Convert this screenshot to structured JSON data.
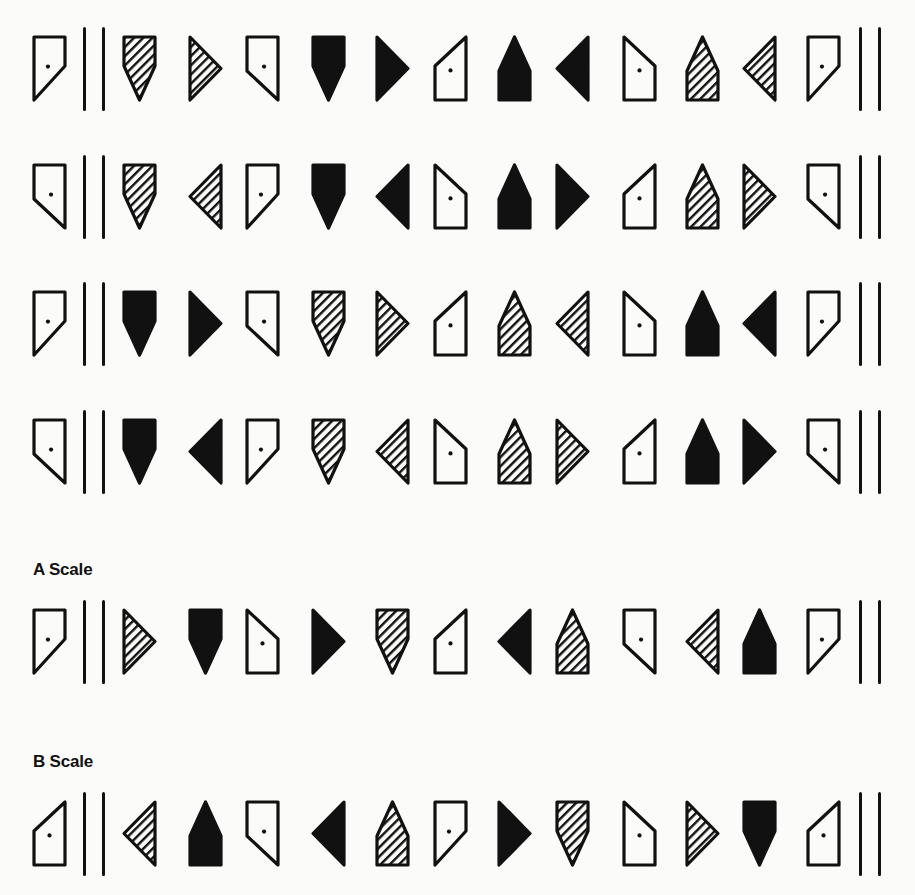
{
  "page": {
    "colors": {
      "ink": "#111111",
      "paper": "#fbfbf9"
    }
  },
  "labels": {
    "a_scale": "A Scale",
    "b_scale": "B Scale"
  },
  "legend": {
    "fills": [
      "open",
      "hatched",
      "solid"
    ],
    "shapes": {
      "open-cut-br": "open pentagon, flat top, diagonal cut bottom-right to lower-left, with dot",
      "open-cut-bl": "open pentagon, flat top, diagonal cut bottom-left to lower-right, with dot",
      "open-cut-tl": "open pentagon, flat bottom, diagonal top-right down to left, with dot",
      "open-cut-tr": "open pentagon, flat bottom, diagonal top-left down to right, with dot",
      "shield-down": "pentagon pointing down",
      "house-up": "pentagon pointing up",
      "tri-right": "triangle pointing right",
      "tri-left": "triangle pointing left",
      "double-bar": "two vertical bars"
    }
  },
  "rows": [
    {
      "id": "row-1",
      "y": 35,
      "items": [
        "open-cut-br",
        "double-bar",
        "hatched-shield-down",
        "hatched-tri-right",
        "open-cut-bl",
        "solid-shield-down",
        "solid-tri-right",
        "open-cut-tl",
        "solid-house-up",
        "solid-tri-left",
        "open-cut-tr",
        "hatched-house-up",
        "hatched-tri-left",
        "open-cut-br",
        "double-bar"
      ]
    },
    {
      "id": "row-2",
      "y": 163,
      "items": [
        "open-cut-bl",
        "double-bar",
        "hatched-shield-down",
        "hatched-tri-left",
        "open-cut-br",
        "solid-shield-down",
        "solid-tri-left",
        "open-cut-tr",
        "solid-house-up",
        "solid-tri-right",
        "open-cut-tl",
        "hatched-house-up",
        "hatched-tri-right",
        "open-cut-bl",
        "double-bar"
      ]
    },
    {
      "id": "row-3",
      "y": 290,
      "items": [
        "open-cut-br",
        "double-bar",
        "solid-shield-down",
        "solid-tri-right",
        "open-cut-bl",
        "hatched-shield-down",
        "hatched-tri-right",
        "open-cut-tl",
        "hatched-house-up",
        "hatched-tri-left",
        "open-cut-tr",
        "solid-house-up",
        "solid-tri-left",
        "open-cut-br",
        "double-bar"
      ]
    },
    {
      "id": "row-4",
      "y": 418,
      "items": [
        "open-cut-bl",
        "double-bar",
        "solid-shield-down",
        "solid-tri-left",
        "open-cut-br",
        "hatched-shield-down",
        "hatched-tri-left",
        "open-cut-tr",
        "hatched-house-up",
        "hatched-tri-right",
        "open-cut-tl",
        "solid-house-up",
        "solid-tri-right",
        "open-cut-bl",
        "double-bar"
      ]
    },
    {
      "id": "a-scale",
      "y": 608,
      "label_key": "a_scale",
      "label_y": 560,
      "items": [
        "open-cut-br",
        "double-bar",
        "hatched-tri-right",
        "solid-shield-down",
        "open-cut-tr",
        "solid-tri-right",
        "hatched-shield-down",
        "open-cut-tl",
        "solid-tri-left",
        "hatched-house-up",
        "open-cut-bl",
        "hatched-tri-left",
        "solid-house-up",
        "open-cut-br",
        "double-bar"
      ]
    },
    {
      "id": "b-scale",
      "y": 800,
      "label_key": "b_scale",
      "label_y": 752,
      "items": [
        "open-cut-tl",
        "double-bar",
        "hatched-tri-left",
        "solid-house-up",
        "open-cut-bl",
        "solid-tri-left",
        "hatched-house-up",
        "open-cut-br",
        "solid-tri-right",
        "hatched-shield-down",
        "open-cut-tr",
        "hatched-tri-right",
        "solid-shield-down",
        "open-cut-tl",
        "double-bar"
      ]
    }
  ]
}
